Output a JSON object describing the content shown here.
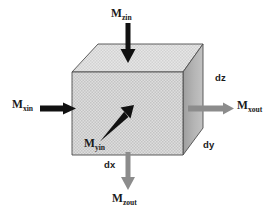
{
  "figure": {
    "shape": "cube",
    "colors": {
      "front_face": "#d9d9d9",
      "top_face": "#e0e0e0",
      "right_face": "#b3b3b3",
      "edge_stroke": "#4d4d4d",
      "arrow_in": "#111111",
      "arrow_out": "#8c8c8c",
      "label_text": "#1a1a1a",
      "background": "#ffffff"
    },
    "labels": {
      "m_zin": {
        "base": "M",
        "sub": "zin",
        "text": "Mzin"
      },
      "m_xin": {
        "base": "M",
        "sub": "xin",
        "text": "Mxin"
      },
      "m_xout": {
        "base": "M",
        "sub": "xout",
        "text": "Mxout"
      },
      "m_zout": {
        "base": "M",
        "sub": "zout",
        "text": "Mzout"
      },
      "m_yin": {
        "base": "M",
        "sub": "yin",
        "text": "Myin"
      },
      "dz": "dz",
      "dy": "dy",
      "dx": "dx"
    },
    "arrows": [
      {
        "name": "m-zin-arrow",
        "direction": "down",
        "color": "dark",
        "label": "Mzin"
      },
      {
        "name": "m-xin-arrow",
        "direction": "right",
        "color": "dark",
        "label": "Mxin"
      },
      {
        "name": "m-yin-arrow",
        "direction": "up-right",
        "color": "dark",
        "label": "Myin"
      },
      {
        "name": "m-xout-arrow",
        "direction": "right",
        "color": "light",
        "label": "Mxout"
      },
      {
        "name": "m-zout-arrow",
        "direction": "down",
        "color": "light",
        "label": "Mzout"
      }
    ]
  }
}
